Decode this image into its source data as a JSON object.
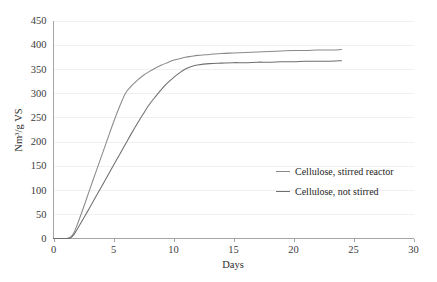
{
  "chart_data": {
    "type": "line",
    "title": "",
    "xlabel": "Days",
    "ylabel": "Nm3/g VS",
    "ylabel_base": "Nm",
    "ylabel_sup": "3",
    "ylabel_tail": "/g VS",
    "xlim": [
      0,
      30
    ],
    "ylim": [
      0,
      450
    ],
    "xticks": [
      0,
      5,
      10,
      15,
      20,
      25,
      30
    ],
    "yticks": [
      0,
      50,
      100,
      150,
      200,
      250,
      300,
      350,
      400,
      450
    ],
    "xtick_labels": [
      "0",
      "5",
      "10",
      "15",
      "20",
      "25",
      "30"
    ],
    "ytick_labels": [
      "0",
      "50",
      "100",
      "150",
      "200",
      "250",
      "300",
      "350",
      "400",
      "450"
    ],
    "grid": "horizontal",
    "legend_position": "inside-right",
    "series": [
      {
        "name": "Cellulose, stirred reactor",
        "color": "#8a8a8a",
        "x": [
          0,
          0.5,
          1,
          1.4,
          1.7,
          2,
          2.3,
          2.7,
          3,
          3.5,
          4,
          4.5,
          5,
          5.5,
          6,
          6.5,
          7,
          7.5,
          8,
          8.5,
          9,
          9.5,
          10,
          10.5,
          11,
          11.5,
          12,
          13,
          14,
          15,
          16,
          17,
          18,
          19,
          20,
          21,
          22,
          23,
          24
        ],
        "y": [
          0,
          0,
          0,
          2,
          12,
          30,
          50,
          78,
          100,
          135,
          170,
          205,
          240,
          272,
          300,
          315,
          327,
          337,
          345,
          352,
          358,
          363,
          368,
          371,
          374,
          376,
          378,
          380,
          382,
          383,
          384,
          385,
          386,
          387,
          388,
          388,
          389,
          389,
          390
        ]
      },
      {
        "name": "Cellulose, not stirred",
        "color": "#6f6f6f",
        "x": [
          0,
          0.5,
          1,
          1.4,
          1.7,
          2,
          2.3,
          2.7,
          3,
          3.5,
          4,
          4.5,
          5,
          5.5,
          6,
          6.5,
          7,
          7.5,
          8,
          8.5,
          9,
          9.5,
          10,
          10.5,
          11,
          11.5,
          12,
          13,
          14,
          15,
          16,
          17,
          18,
          19,
          20,
          21,
          22,
          23,
          24
        ],
        "y": [
          0,
          0,
          0,
          1,
          8,
          20,
          33,
          50,
          63,
          85,
          107,
          129,
          151,
          173,
          195,
          217,
          238,
          258,
          277,
          293,
          308,
          321,
          332,
          342,
          350,
          355,
          358,
          361,
          362,
          363,
          363,
          364,
          364,
          365,
          365,
          366,
          366,
          366,
          367
        ]
      }
    ],
    "annotations": [
      {
        "text": "stirred reactor shows a distinct inflection near day 6 at about 300",
        "x": 6,
        "y": 300
      }
    ]
  },
  "legend": {
    "entries": [
      {
        "label": "Cellulose, stirred reactor"
      },
      {
        "label": "Cellulose, not stirred"
      }
    ]
  },
  "axes": {
    "x_title": "Days",
    "y_title_base": "Nm",
    "y_title_sup": "3",
    "y_title_tail": "/g VS"
  },
  "colors": {
    "series_stirred": "#8a8a8a",
    "series_not_stirred": "#6f6f6f",
    "gridline": "#e9e9ec",
    "axis": "#8d8d8d",
    "text": "#2b2b2b",
    "background": "#ffffff"
  }
}
